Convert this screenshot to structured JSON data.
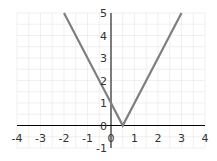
{
  "chart_data": {
    "type": "line",
    "title": "",
    "xlabel": "",
    "ylabel": "",
    "function": "y = |2x - 1|",
    "xlim": [
      -4,
      4
    ],
    "ylim": [
      -1,
      5
    ],
    "grid": true,
    "x_ticks": [
      "-4",
      "-3",
      "-2",
      "-1",
      "0",
      "1",
      "2",
      "3",
      "4"
    ],
    "y_ticks": [
      "-1",
      "0",
      "1",
      "2",
      "3",
      "4",
      "5"
    ],
    "series": [
      {
        "name": "y = |2x - 1|",
        "color": "#7f7f7f",
        "x": [
          -2,
          0,
          0.5,
          3
        ],
        "y": [
          5,
          1,
          0,
          5
        ]
      }
    ]
  },
  "colors": {
    "line": "#7f7f7f",
    "axis": "#000000",
    "grid": "#e6e6e6"
  }
}
